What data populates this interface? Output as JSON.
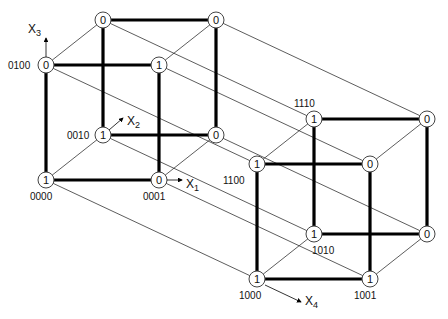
{
  "axes": [
    {
      "id": "x1",
      "label": "X",
      "sub": "1"
    },
    {
      "id": "x2",
      "label": "X",
      "sub": "2"
    },
    {
      "id": "x3",
      "label": "X",
      "sub": "3"
    },
    {
      "id": "x4",
      "label": "X",
      "sub": "4"
    }
  ],
  "nodes": [
    {
      "code": "0000",
      "value": "1",
      "label": "0000",
      "show_label": true
    },
    {
      "code": "0001",
      "value": "0",
      "label": "0001",
      "show_label": true
    },
    {
      "code": "0010",
      "value": "1",
      "label": "0010",
      "show_label": true
    },
    {
      "code": "0011",
      "value": "0",
      "label": "",
      "show_label": false
    },
    {
      "code": "0100",
      "value": "0",
      "label": "0100",
      "show_label": true
    },
    {
      "code": "0101",
      "value": "1",
      "label": "",
      "show_label": false
    },
    {
      "code": "0110",
      "value": "0",
      "label": "",
      "show_label": false
    },
    {
      "code": "0111",
      "value": "0",
      "label": "",
      "show_label": false
    },
    {
      "code": "1000",
      "value": "1",
      "label": "1000",
      "show_label": true
    },
    {
      "code": "1001",
      "value": "1",
      "label": "1001",
      "show_label": true
    },
    {
      "code": "1010",
      "value": "1",
      "label": "1010",
      "show_label": true
    },
    {
      "code": "1011",
      "value": "0",
      "label": "",
      "show_label": false
    },
    {
      "code": "1100",
      "value": "1",
      "label": "1100",
      "show_label": true
    },
    {
      "code": "1101",
      "value": "0",
      "label": "",
      "show_label": false
    },
    {
      "code": "1110",
      "value": "1",
      "label": "1110",
      "show_label": true
    },
    {
      "code": "1111",
      "value": "0",
      "label": "",
      "show_label": false
    }
  ],
  "edge_styles": {
    "x1": "bold",
    "x2": "thin",
    "x3": "bold",
    "x4": "thin"
  }
}
